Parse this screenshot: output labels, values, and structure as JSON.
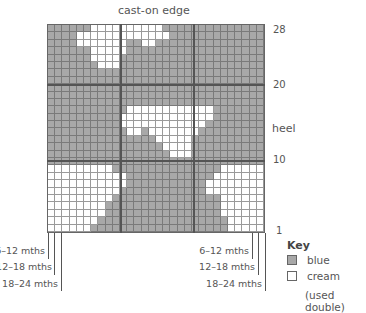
{
  "chart": {
    "title": "cast-on edge",
    "columns": 30,
    "rows": 28,
    "heel_label": "heel",
    "row_labels": [
      {
        "label": "28",
        "row": 28
      },
      {
        "label": "20",
        "row": 20
      },
      {
        "label": "10",
        "row": 10
      },
      {
        "label": "1",
        "row": 1
      }
    ],
    "pattern_top_to_bottom": [
      "BBBBBBCCCCCCCCCCBBBBBBBBBBBBBB",
      "BBBBCCCCCCCCCCCCCBBBBBBBBBBBBB",
      "BBBBCCCCCCCBBCCBBBBBBBBBBBBBBB",
      "BBBBBBCCCCCBBBBBBBBBBBBBBBBBBB",
      "BBBBBBCCCCBBBBBBBBBBBBBBBBBBBB",
      "BBBBBBBCCCBBBBBBBBBBBBBBBBBBBB",
      "BBBBBBBBBBBBBBBBBBBBBBBBBBBBBB",
      "BBBBBBBBBBBBBBBBBBBBBBBBBBBBBB",
      "BBBBBBBBBBBBBBBBBBBBBBBBBBBBBB",
      "BBBBBBBBBBBBBBBBBBBBBBBBBBBBBB",
      "BBBBBBBBBBBBBBBBBBBBBBBBBBBBBB",
      "BBBBBBBBBBBCCCCCCCCCCCCBBBBBBB",
      "BBBBBBBBBBCCCCCCCCCCCCCBBBBBBB",
      "BBBBBBBBBBCCCCCCCCCCCCBBBBBBBB",
      "BBBBBBBBBBBCCBCCCCCCCBBBBBBBBB",
      "BBBBBBBBBBBBBBBCCCCCBBBBBBBBBB",
      "BBBBBBBBBBBBBBBBCCCCBBBBBBBBBB",
      "BBBBBBBBBBBBBBBBBCCCBBBBBBBBBB",
      "BBBBBBBBBBBBBBBBBBBBBBBBBBBBBB",
      "CCCCCCCCCBBBBBBBBBBBBBBBCCCCCC",
      "CCCCCCCCCCCBBBBBBBBBBBBCCCCCCC",
      "CCCCCCCCCCCBBBBBBBBBBBCCCCCCCC",
      "CCCCCCCCCCBBBBBBBBBBBBCCCCCCCC",
      "CCCCCCCCCBBBBBBBBBBBBBBBCCCCCC",
      "CCCCCCCCBBBBBBBBBBBBBBBBCCCCCC",
      "CCCCCCCCBBBBBBBBBBBBBBBBCCCCCC",
      "CCCCCCCBBBBBBBBBBBBBBBBBBCCCCC",
      "CCCCCCBBBBBBBBBBBBBBBBBBBCCCCC"
    ]
  },
  "sizes": {
    "left": [
      "6–12 mths",
      "12–18 mths",
      "18–24 mths"
    ],
    "right": [
      "6–12 mths",
      "12–18 mths",
      "18–24 mths"
    ]
  },
  "key": {
    "title": "Key",
    "items": [
      {
        "label": "blue",
        "color": "#a8a8a8"
      },
      {
        "label": "cream",
        "color": "#ffffff"
      }
    ],
    "note": "(used double)"
  }
}
